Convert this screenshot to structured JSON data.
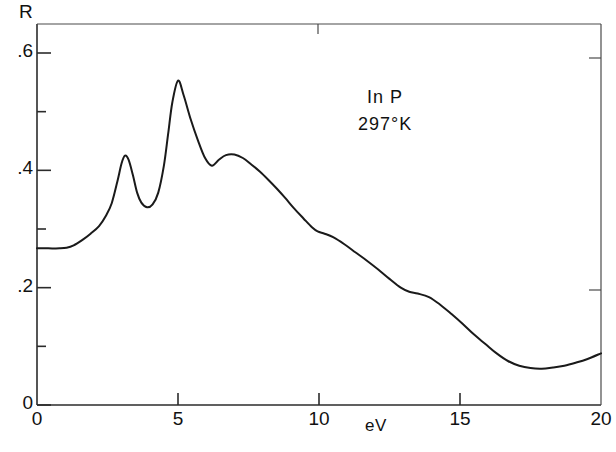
{
  "figure": {
    "ylabel": "R",
    "xlabel": "eV",
    "annotation": {
      "material": "In P",
      "temperature": "297°K"
    },
    "yticks": [
      {
        "label": ".6",
        "value": 0.6
      },
      {
        "label": "",
        "value": 0.5
      },
      {
        "label": ".4",
        "value": 0.4
      },
      {
        "label": "",
        "value": 0.3
      },
      {
        "label": ".2",
        "value": 0.2
      },
      {
        "label": "",
        "value": 0.1
      },
      {
        "label": "0",
        "value": 0.0
      }
    ],
    "xticks": [
      {
        "label": "0",
        "value": 0
      },
      {
        "label": "5",
        "value": 5
      },
      {
        "label": "10",
        "value": 10
      },
      {
        "label": "15",
        "value": 15
      },
      {
        "label": "20",
        "value": 20
      }
    ],
    "colors": {
      "curve": "#1a1a1a",
      "axis": "#2b2b2b",
      "background": "#ffffff"
    }
  },
  "chart_data": {
    "type": "line",
    "title": "",
    "subtitle": "",
    "xlabel": "eV",
    "ylabel": "R",
    "xlim": [
      0,
      20
    ],
    "ylim": [
      0,
      0.665
    ],
    "grid": false,
    "legend": null,
    "annotations": [
      "In P",
      "297°K"
    ],
    "series": [
      {
        "name": "In P reflectance 297°K",
        "x": [
          0.0,
          0.4,
          0.8,
          1.05,
          1.3,
          1.6,
          1.9,
          2.2,
          2.45,
          2.65,
          2.85,
          3.0,
          3.12,
          3.25,
          3.4,
          3.55,
          3.7,
          3.9,
          4.1,
          4.3,
          4.5,
          4.65,
          4.8,
          5.0,
          5.2,
          5.45,
          5.7,
          5.95,
          6.2,
          6.45,
          6.7,
          7.0,
          7.3,
          7.6,
          7.9,
          8.2,
          8.5,
          8.8,
          9.1,
          9.45,
          9.75,
          9.95,
          10.2,
          10.5,
          10.9,
          11.3,
          11.7,
          12.1,
          12.5,
          12.9,
          13.2,
          13.5,
          13.9,
          14.3,
          14.7,
          15.1,
          15.5,
          15.9,
          16.3,
          16.7,
          17.1,
          17.5,
          17.9,
          18.3,
          18.7,
          19.1,
          19.5,
          20.0
        ],
        "y": [
          0.267,
          0.267,
          0.267,
          0.268,
          0.272,
          0.281,
          0.292,
          0.305,
          0.323,
          0.344,
          0.381,
          0.412,
          0.425,
          0.418,
          0.392,
          0.362,
          0.345,
          0.337,
          0.342,
          0.362,
          0.408,
          0.462,
          0.516,
          0.553,
          0.528,
          0.487,
          0.452,
          0.422,
          0.408,
          0.418,
          0.426,
          0.427,
          0.421,
          0.41,
          0.398,
          0.384,
          0.369,
          0.353,
          0.336,
          0.318,
          0.303,
          0.296,
          0.292,
          0.286,
          0.274,
          0.26,
          0.246,
          0.231,
          0.215,
          0.2,
          0.193,
          0.19,
          0.184,
          0.171,
          0.155,
          0.138,
          0.12,
          0.104,
          0.088,
          0.075,
          0.067,
          0.063,
          0.062,
          0.064,
          0.067,
          0.072,
          0.078,
          0.088
        ]
      }
    ],
    "features": [
      {
        "name": "baseline",
        "x_range": [
          0,
          1.1
        ],
        "y": 0.267
      },
      {
        "name": "E1 peak",
        "x": 3.12,
        "y": 0.425
      },
      {
        "name": "minimum between peaks",
        "x": 3.9,
        "y": 0.337
      },
      {
        "name": "E2 main peak",
        "x": 5.0,
        "y": 0.553
      },
      {
        "name": "local minimum",
        "x": 6.2,
        "y": 0.408
      },
      {
        "name": "secondary maximum",
        "x": 7.0,
        "y": 0.427
      },
      {
        "name": "shoulder",
        "x": 10.0,
        "y": 0.293
      },
      {
        "name": "shoulder",
        "x": 13.4,
        "y": 0.19
      },
      {
        "name": "global minimum",
        "x": 17.5,
        "y": 0.063
      },
      {
        "name": "endpoint",
        "x": 20.0,
        "y": 0.088
      }
    ]
  }
}
